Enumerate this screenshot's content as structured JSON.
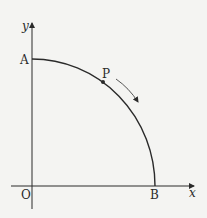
{
  "diagram": {
    "labels": {
      "y_axis": "y",
      "x_axis": "x",
      "origin": "O",
      "point_a": "A",
      "point_b": "B",
      "point_p": "P"
    },
    "colors": {
      "background": "#f4f4f2",
      "stroke": "#2a2a2a",
      "arrow": "#555555"
    }
  }
}
